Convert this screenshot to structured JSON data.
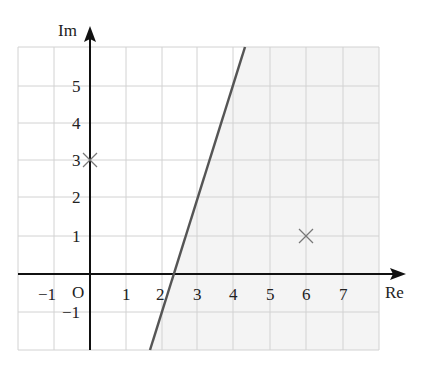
{
  "diagram": {
    "type": "argand-diagram",
    "axes": {
      "x_label": "Re",
      "y_label": "Im",
      "origin_label": "O"
    },
    "x_ticks": [
      "−1",
      "1",
      "2",
      "3",
      "4",
      "5",
      "6",
      "7"
    ],
    "y_ticks": [
      "5",
      "4",
      "3",
      "2",
      "1",
      "−1"
    ],
    "points": [
      {
        "label": "3i",
        "re": 0,
        "im": 3,
        "marker": "cross"
      },
      {
        "label": "6+i",
        "re": 6,
        "im": 1,
        "marker": "cross"
      }
    ],
    "boundary_line": {
      "from": [
        1.65,
        -2
      ],
      "to": [
        4.3,
        6
      ],
      "color": "#555555"
    },
    "shaded_region": "right of boundary line",
    "colors": {
      "shade": "#f4f4f4",
      "grid": "#d0d0d0",
      "axis": "#111111",
      "marker": "#777777"
    }
  }
}
